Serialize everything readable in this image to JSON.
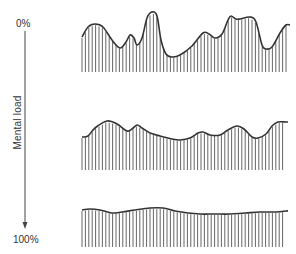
{
  "axis": {
    "top_label": "0%",
    "bottom_label": "100%",
    "title": "Mental load"
  },
  "colors": {
    "stroke": "#333333",
    "hatch": "#555555"
  },
  "chart_data": {
    "type": "area",
    "title": "",
    "ylabel": "Mental load",
    "y_axis_ticks": [
      "0%",
      "100%"
    ],
    "series": [
      {
        "name": "high variability (top)",
        "baseline_y": 72,
        "points": [
          [
            82,
            37
          ],
          [
            88,
            27
          ],
          [
            95,
            24
          ],
          [
            103,
            27
          ],
          [
            112,
            40
          ],
          [
            120,
            48
          ],
          [
            126,
            42
          ],
          [
            130,
            35
          ],
          [
            134,
            38
          ],
          [
            137,
            45
          ],
          [
            142,
            38
          ],
          [
            147,
            18
          ],
          [
            152,
            12
          ],
          [
            157,
            16
          ],
          [
            161,
            40
          ],
          [
            166,
            54
          ],
          [
            172,
            57
          ],
          [
            180,
            55
          ],
          [
            192,
            46
          ],
          [
            203,
            33
          ],
          [
            209,
            34
          ],
          [
            215,
            38
          ],
          [
            222,
            34
          ],
          [
            228,
            20
          ],
          [
            231,
            16
          ],
          [
            236,
            19
          ],
          [
            240,
            19
          ],
          [
            250,
            17
          ],
          [
            256,
            22
          ],
          [
            262,
            45
          ],
          [
            266,
            49
          ],
          [
            272,
            47
          ],
          [
            280,
            33
          ],
          [
            286,
            25
          ],
          [
            290,
            25
          ]
        ]
      },
      {
        "name": "moderate variability (middle)",
        "baseline_y": 170,
        "points": [
          [
            82,
            137
          ],
          [
            88,
            136
          ],
          [
            95,
            128
          ],
          [
            107,
            121
          ],
          [
            117,
            124
          ],
          [
            127,
            131
          ],
          [
            132,
            129
          ],
          [
            137,
            125
          ],
          [
            142,
            128
          ],
          [
            150,
            133
          ],
          [
            160,
            136
          ],
          [
            172,
            139
          ],
          [
            180,
            140
          ],
          [
            190,
            138
          ],
          [
            198,
            133
          ],
          [
            203,
            132
          ],
          [
            210,
            135
          ],
          [
            220,
            135
          ],
          [
            228,
            130
          ],
          [
            237,
            126
          ],
          [
            244,
            129
          ],
          [
            252,
            137
          ],
          [
            258,
            138
          ],
          [
            266,
            134
          ],
          [
            272,
            126
          ],
          [
            278,
            122
          ],
          [
            286,
            122
          ],
          [
            288,
            122
          ]
        ]
      },
      {
        "name": "low variability (bottom)",
        "baseline_y": 247,
        "points": [
          [
            82,
            210
          ],
          [
            90,
            209
          ],
          [
            100,
            210
          ],
          [
            112,
            213
          ],
          [
            122,
            212
          ],
          [
            135,
            210
          ],
          [
            150,
            208
          ],
          [
            163,
            208
          ],
          [
            175,
            211
          ],
          [
            188,
            213
          ],
          [
            200,
            214
          ],
          [
            215,
            214
          ],
          [
            230,
            214
          ],
          [
            245,
            213
          ],
          [
            260,
            212
          ],
          [
            276,
            212
          ],
          [
            286,
            211
          ],
          [
            288,
            211
          ]
        ]
      }
    ]
  }
}
